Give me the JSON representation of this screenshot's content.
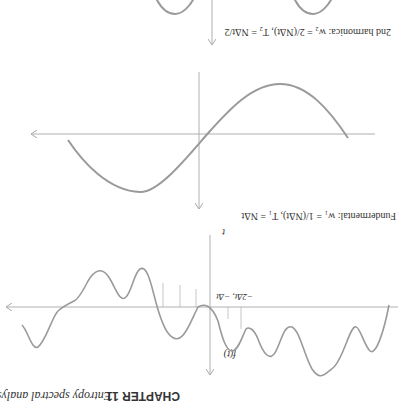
{
  "page": {
    "heading_bold": "CHAPTER 11",
    "heading_rest": "Entropy spectral analysis",
    "orientation": "rotated 180°"
  },
  "panels": {
    "signal": {
      "y_label": "f(t)",
      "x_label": "t",
      "tick_label": "−2Δt, −Δt"
    },
    "fundamental": {
      "caption": "Fundermental: w₁ = 1/(NΔt), T₁ = NΔt"
    },
    "second_harmonic": {
      "caption": "2nd harmonica: w₂ = 2/(NΔt), T₂ = NΔt/2"
    }
  },
  "colors": {
    "curve": "#9a9a9a",
    "axis": "#b0b0b0",
    "text": "#333333"
  }
}
